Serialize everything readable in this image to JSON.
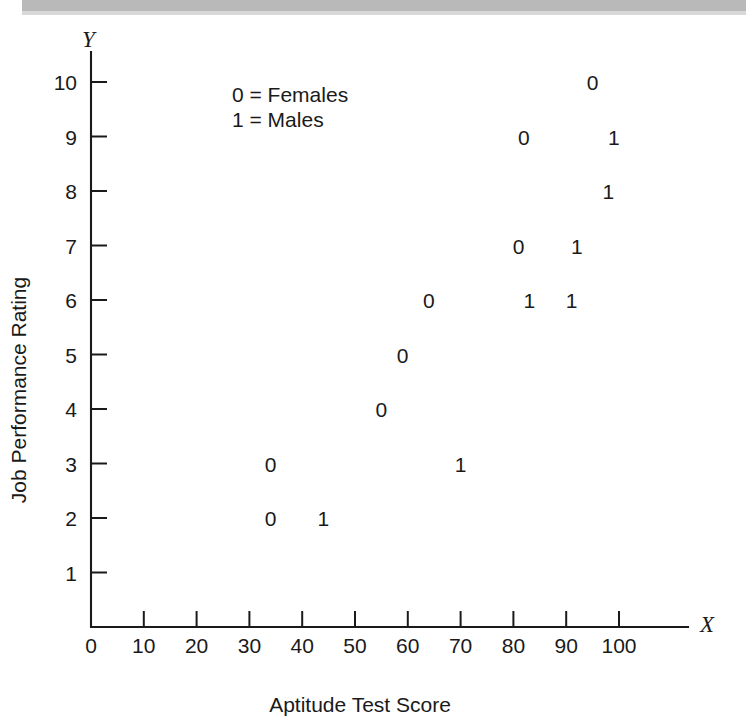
{
  "header": {
    "band_present": true,
    "band_color": "#b9b9b9"
  },
  "figure": {
    "x_axis_letter": "X",
    "y_axis_letter": "Y"
  },
  "legend": {
    "lines": [
      "0 = Females",
      "1 = Males"
    ]
  },
  "chart_data": {
    "type": "scatter",
    "title": "",
    "xlabel": "Aptitude Test Score",
    "ylabel": "Job Performance Rating",
    "xlim": [
      0,
      110
    ],
    "ylim": [
      0,
      10.6
    ],
    "xticks": [
      0,
      10,
      20,
      30,
      40,
      50,
      60,
      70,
      80,
      90,
      100
    ],
    "xticklabels": [
      "0",
      "10",
      "20",
      "30",
      "40",
      "50",
      "60",
      "70",
      "80",
      "90",
      "100"
    ],
    "yticks": [
      1,
      2,
      3,
      4,
      5,
      6,
      7,
      8,
      9,
      10
    ],
    "yticklabels": [
      "1",
      "2",
      "3",
      "4",
      "5",
      "6",
      "7",
      "8",
      "9",
      "10"
    ],
    "y_origin_label": "0",
    "grid": false,
    "legend_position": "upper-left-inside",
    "marker_style": "text-glyph",
    "series": [
      {
        "name": "0 = Females",
        "marker": "0",
        "points": [
          {
            "x": 34,
            "y": 3
          },
          {
            "x": 34,
            "y": 2
          },
          {
            "x": 55,
            "y": 4
          },
          {
            "x": 59,
            "y": 5
          },
          {
            "x": 64,
            "y": 6
          },
          {
            "x": 81,
            "y": 7
          },
          {
            "x": 82,
            "y": 9
          },
          {
            "x": 95,
            "y": 10
          }
        ]
      },
      {
        "name": "1 = Males",
        "marker": "1",
        "points": [
          {
            "x": 44,
            "y": 2
          },
          {
            "x": 70,
            "y": 3
          },
          {
            "x": 83,
            "y": 6
          },
          {
            "x": 91,
            "y": 6
          },
          {
            "x": 92,
            "y": 7
          },
          {
            "x": 98,
            "y": 8
          },
          {
            "x": 99,
            "y": 9
          }
        ]
      }
    ]
  }
}
